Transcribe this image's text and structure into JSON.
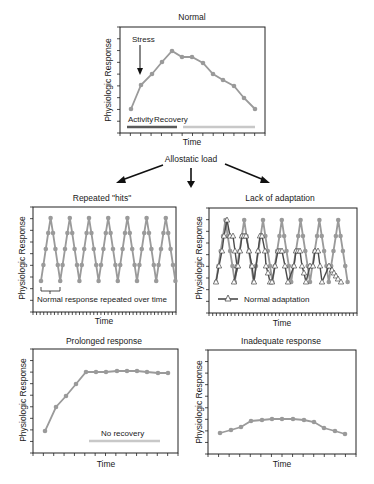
{
  "figure": {
    "center_label": "Allostatic load",
    "colors": {
      "series_gray": "#9a9a9a",
      "series_dark": "#4a4a4a",
      "frame": "#222222",
      "activity_bar": "#5a5a5a",
      "recovery_bar": "#c8c8c8",
      "no_recovery_bar": "#c8c8c8",
      "arrow": "#111111"
    }
  },
  "chart_data": [
    {
      "id": "normal",
      "type": "line",
      "title": "Normal",
      "xlabel": "Time",
      "ylabel": "Physiologic Response",
      "frame": {
        "x": 120,
        "y": 27,
        "w": 145,
        "h": 106
      },
      "annotations": {
        "stress": "Stress",
        "activity": "Activity",
        "recovery": "Recovery"
      },
      "series": [
        {
          "name": "Response",
          "marker": "circle",
          "points": [
            [
              131,
              109
            ],
            [
              141,
              85
            ],
            [
              152,
              74
            ],
            [
              162,
              62
            ],
            [
              172,
              51
            ],
            [
              182,
              57
            ],
            [
              192,
              57
            ],
            [
              203,
              63
            ],
            [
              213,
              74
            ],
            [
              223,
              80
            ],
            [
              234,
              86
            ],
            [
              244,
              98
            ],
            [
              255,
              109
            ]
          ]
        }
      ]
    },
    {
      "id": "repeated-hits",
      "type": "line",
      "title": "Repeated \"hits\"",
      "xlabel": "Time",
      "ylabel": "Physiologic Response",
      "frame": {
        "x": 33,
        "y": 207,
        "w": 143,
        "h": 105
      },
      "annotations": {
        "bracket": "Normal response repeated over time"
      },
      "series": [
        {
          "name": "Repeated hits",
          "marker": "circle",
          "cycle": {
            "x0": 41,
            "period": 19.2,
            "count": 7,
            "levels": [
              281,
              265,
              249,
              233,
              218,
              233,
              249,
              265,
              281
            ]
          }
        }
      ]
    },
    {
      "id": "lack-of-adaptation",
      "type": "line",
      "title": "Lack of adaptation",
      "xlabel": "Time",
      "ylabel": "Physiologic Response",
      "frame": {
        "x": 209,
        "y": 208,
        "w": 148,
        "h": 105
      },
      "legend": {
        "label": "Normal adaptation",
        "marker": "triangle-open"
      },
      "series": [
        {
          "name": "Lack of adaptation",
          "marker": "circle",
          "cycle": {
            "x0": 216,
            "period": 18.8,
            "count": 7,
            "levels": [
              282,
              266,
              251,
              236,
              220,
              236,
              251,
              266,
              282
            ]
          }
        },
        {
          "name": "Normal adaptation",
          "marker": "triangle-open",
          "points": [
            [
              216,
              282
            ],
            [
              219,
              266
            ],
            [
              222,
              251
            ],
            [
              224,
              236
            ],
            [
              227,
              220
            ],
            [
              230,
              236
            ],
            [
              233,
              236
            ],
            [
              235,
              251
            ],
            [
              237,
              266
            ],
            [
              234,
              282
            ],
            [
              238,
              266
            ],
            [
              240,
              251
            ],
            [
              242,
              236
            ],
            [
              244,
              236
            ],
            [
              246,
              236
            ],
            [
              249,
              251
            ],
            [
              252,
              266
            ],
            [
              254,
              282
            ],
            [
              258,
              251
            ],
            [
              260,
              236
            ],
            [
              262,
              236
            ],
            [
              265,
              251
            ],
            [
              266,
              266
            ],
            [
              268,
              273
            ],
            [
              270,
              282
            ],
            [
              272,
              282
            ],
            [
              275,
              266
            ],
            [
              278,
              251
            ],
            [
              280,
              251
            ],
            [
              282,
              251
            ],
            [
              285,
              266
            ],
            [
              288,
              282
            ],
            [
              294,
              266
            ],
            [
              296,
              251
            ],
            [
              298,
              251
            ],
            [
              300,
              251
            ],
            [
              302,
              266
            ],
            [
              304,
              273
            ],
            [
              306,
              282
            ],
            [
              310,
              266
            ],
            [
              313,
              266
            ],
            [
              315,
              251
            ],
            [
              318,
              251
            ],
            [
              320,
              266
            ],
            [
              322,
              282
            ],
            [
              329,
              266
            ],
            [
              332,
              270
            ],
            [
              334,
              273
            ],
            [
              336,
              276
            ],
            [
              338,
              279
            ],
            [
              341,
              282
            ]
          ]
        }
      ]
    },
    {
      "id": "prolonged-response",
      "type": "line",
      "title": "Prolonged response",
      "xlabel": "Time",
      "ylabel": "Physiologic Response",
      "frame": {
        "x": 33,
        "y": 349,
        "w": 145,
        "h": 104
      },
      "annotations": {
        "no_recovery": "No recovery"
      },
      "series": [
        {
          "name": "Response",
          "marker": "circle",
          "points": [
            [
              45,
              431
            ],
            [
              56,
              407
            ],
            [
              66,
              396
            ],
            [
              76,
              384
            ],
            [
              86,
              372
            ],
            [
              96,
              372
            ],
            [
              106,
              372
            ],
            [
              117,
              371
            ],
            [
              127,
              371
            ],
            [
              137,
              371
            ],
            [
              147,
              372
            ],
            [
              158,
              373
            ],
            [
              168,
              373
            ]
          ]
        }
      ]
    },
    {
      "id": "inadequate-response",
      "type": "line",
      "title": "Inadequate response",
      "xlabel": "Time",
      "ylabel": "Physiologic Response",
      "frame": {
        "x": 208,
        "y": 350,
        "w": 148,
        "h": 104
      },
      "series": [
        {
          "name": "Response",
          "marker": "circle",
          "points": [
            [
              220,
              433
            ],
            [
              231,
              430
            ],
            [
              241,
              427
            ],
            [
              251,
              421
            ],
            [
              262,
              420
            ],
            [
              272,
              419
            ],
            [
              282,
              419
            ],
            [
              293,
              419
            ],
            [
              304,
              420
            ],
            [
              314,
              422
            ],
            [
              324,
              428
            ],
            [
              335,
              431
            ],
            [
              345,
              434
            ]
          ]
        }
      ]
    }
  ]
}
